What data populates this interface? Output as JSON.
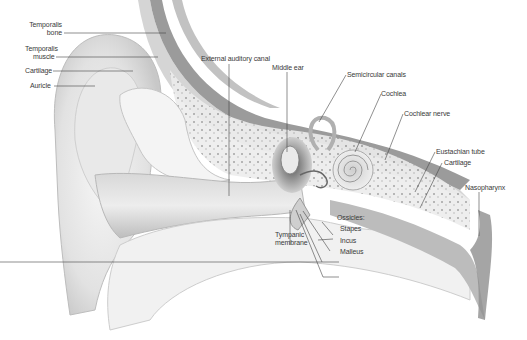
{
  "diagram": {
    "labels": {
      "temporalis_bone": [
        "Temporalis",
        "bone"
      ],
      "temporalis_muscle": [
        "Temporalis",
        "muscle"
      ],
      "cartilage_outer": "Cartilage",
      "auricle": "Auricle",
      "external_auditory_canal": "External auditory canal",
      "middle_ear": "Middle ear",
      "semicircular_canals": "Semicircular canals",
      "cochlea": "Cochlea",
      "cochlear_nerve": "Cochlear nerve",
      "eustachian_tube": "Eustachian tube",
      "cartilage_tube": "Cartilage",
      "nasopharynx": "Nasopharynx",
      "ossicles": "Ossicles:",
      "stapes": "Stapes",
      "incus": "Incus",
      "malleus": "Malleus",
      "tympanic_membrane": [
        "Tympanic",
        "membrane"
      ]
    },
    "colors": {
      "background": "#ffffff",
      "label_text": "#3a3a3a",
      "leader_line": "#444444",
      "muscle": "#8a8a8a",
      "skin_light": "#efefef",
      "shadow": "#9a9a9a"
    }
  }
}
